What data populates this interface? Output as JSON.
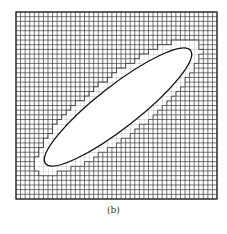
{
  "figure": {
    "caption": "(b)",
    "grid": {
      "x0": 16,
      "y0": 12,
      "x1": 217,
      "y1": 199,
      "cols": 44,
      "rows": 40,
      "line_color": "#3a3a3a",
      "frame_color": "#222222"
    },
    "ellipse": {
      "cx": 118,
      "cy": 107,
      "rx": 92,
      "ry": 21,
      "rotation_deg": -38,
      "stroke": "#111111",
      "fill": "#ffffff"
    },
    "staircase_margin": 1.12
  }
}
